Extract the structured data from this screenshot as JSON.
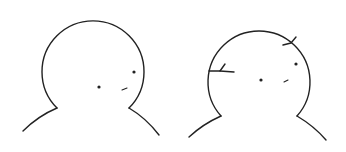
{
  "illustration": {
    "panels": [
      {
        "label": "intact head",
        "state": "intact",
        "head": {
          "cx": 92,
          "cy": 62,
          "r": 51
        },
        "eyes": [
          {
            "cx": 99,
            "cy": 87
          },
          {
            "cx": 134,
            "cy": 72
          }
        ],
        "mouth": {
          "x1": 122,
          "y1": 90,
          "x2": 127,
          "y2": 88
        },
        "shoulders": {
          "left": "M57 108 Q38 116 23 131",
          "right": "M129 108 Q146 118 159 135"
        }
      },
      {
        "label": "cracked head",
        "state": "cracked",
        "head": {
          "cx": 259,
          "cy": 70,
          "r": 51
        },
        "eyes": [
          {
            "cx": 261,
            "cy": 80
          },
          {
            "cx": 296,
            "cy": 64
          }
        ],
        "mouth": {
          "x1": 284,
          "y1": 82,
          "x2": 288,
          "y2": 80
        },
        "shoulders": {
          "left": "M221 116 Q203 124 189 137",
          "right": "M297 116 Q314 126 326 140"
        },
        "cracks": [
          "M209 71 L220 71 L225 64",
          "M220 71 L234 72",
          "M283 45 L291 43 L296 37"
        ]
      }
    ],
    "colors": {
      "line": "#222222",
      "background": "#ffffff"
    }
  }
}
